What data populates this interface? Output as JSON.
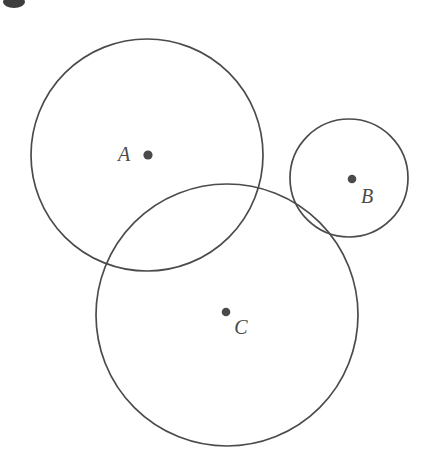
{
  "figure": {
    "background_color": "#ffffff",
    "stroke_color": "#4b4b4b",
    "dot_color": "#4a4a4a",
    "label_color": "#4a4a4a",
    "width": 422,
    "height": 458
  },
  "circles": [
    {
      "id": "A",
      "label": "A",
      "cx": 147,
      "cy": 155,
      "r": 116,
      "dot_x": 148,
      "dot_y": 155,
      "dot_r": 4.6,
      "label_x": 124,
      "label_y": 161
    },
    {
      "id": "B",
      "label": "B",
      "cx": 349,
      "cy": 178,
      "r": 59,
      "dot_x": 352,
      "dot_y": 179,
      "dot_r": 4.3,
      "label_x": 367,
      "label_y": 203
    },
    {
      "id": "C",
      "label": "C",
      "cx": 227,
      "cy": 315,
      "r": 131,
      "dot_x": 226,
      "dot_y": 312,
      "dot_r": 4.3,
      "label_x": 241,
      "label_y": 334
    }
  ],
  "artifact": {
    "name": "top-left-crop-mark",
    "cx": 14,
    "cy": 2,
    "rx": 11,
    "ry": 6
  }
}
